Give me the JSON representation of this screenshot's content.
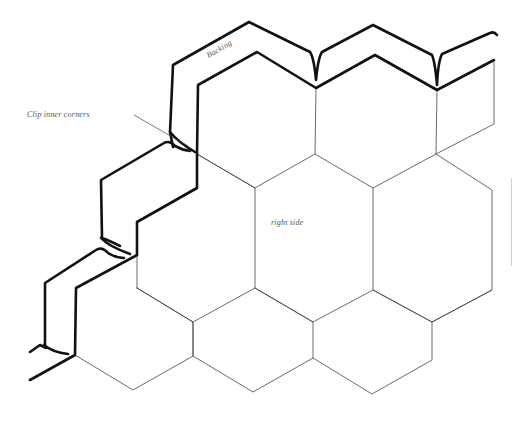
{
  "diagram": {
    "labels": {
      "backing": "Backing",
      "clip_inner_corners": "Clip inner corners",
      "right_side": "right side"
    },
    "colors": {
      "background": "#ffffff",
      "thick_outline": "#111111",
      "thin_seam": "#444444",
      "label_text": "#555555"
    },
    "layout": {
      "hex_rows": 3,
      "hexes_per_row": [
        3,
        3,
        3
      ],
      "hex_width_px": 118,
      "hex_height_px": 136
    }
  }
}
